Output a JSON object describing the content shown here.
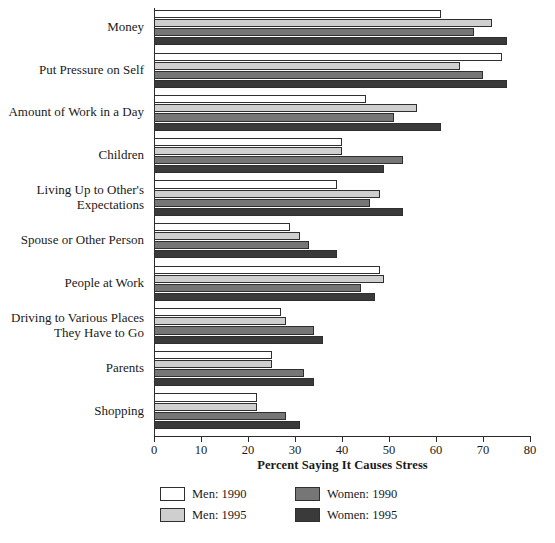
{
  "chart_data": {
    "type": "bar",
    "orientation": "horizontal",
    "title": "",
    "xlabel": "Percent Saying It Causes Stress",
    "ylabel": "",
    "xlim": [
      0,
      80
    ],
    "xticks": [
      0,
      10,
      20,
      30,
      40,
      50,
      60,
      70,
      80
    ],
    "grid": false,
    "legend_position": "bottom",
    "categories": [
      "Money",
      "Put Pressure on Self",
      "Amount of Work in a Day",
      "Children",
      "Living Up to Other's\nExpectations",
      "Spouse or Other Person",
      "People at Work",
      "Driving to Various Places\nThey Have to Go",
      "Parents",
      "Shopping"
    ],
    "series": [
      {
        "name": "Men: 1990",
        "color": "#ffffff",
        "values": [
          61,
          74,
          45,
          40,
          39,
          29,
          48,
          27,
          25,
          22
        ]
      },
      {
        "name": "Men: 1995",
        "color": "#cfcfcf",
        "values": [
          72,
          65,
          56,
          40,
          48,
          31,
          49,
          28,
          25,
          22
        ]
      },
      {
        "name": "Women: 1990",
        "color": "#767676",
        "values": [
          68,
          70,
          51,
          53,
          46,
          33,
          44,
          34,
          32,
          28
        ]
      },
      {
        "name": "Women: 1995",
        "color": "#3a3a3a",
        "values": [
          75,
          75,
          61,
          49,
          53,
          39,
          47,
          36,
          34,
          31
        ]
      }
    ]
  },
  "legend": {
    "items": [
      {
        "label": "Men: 1990",
        "color": "#ffffff"
      },
      {
        "label": "Women: 1990",
        "color": "#767676"
      },
      {
        "label": "Men: 1995",
        "color": "#cfcfcf"
      },
      {
        "label": "Women: 1995",
        "color": "#3a3a3a"
      }
    ]
  }
}
